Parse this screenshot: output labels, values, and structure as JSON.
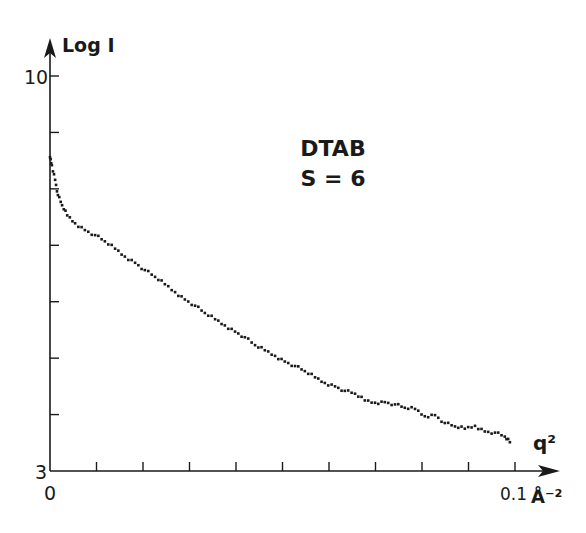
{
  "chart_data": {
    "type": "scatter",
    "title": "",
    "annotation": [
      "DTAB",
      "S = 6"
    ],
    "xlabel": "q²",
    "xunit": "Å⁻²",
    "ylabel": "Log I",
    "xlim": [
      0,
      0.1
    ],
    "ylim": [
      3,
      10
    ],
    "x_tick_labels": [
      "0",
      "0.1"
    ],
    "x_ticks": [
      0,
      0.01,
      0.02,
      0.03,
      0.04,
      0.05,
      0.06,
      0.07,
      0.08,
      0.09,
      0.1
    ],
    "y_tick_labels": [
      "3",
      "10"
    ],
    "y_ticks": [
      3,
      4,
      5,
      6,
      7,
      8,
      9,
      10
    ],
    "grid": false,
    "legend": null,
    "series": [
      {
        "name": "DTAB S=6",
        "x": [
          0.0,
          0.0004,
          0.0011,
          0.0017,
          0.0026,
          0.0037,
          0.0054,
          0.0075,
          0.0097,
          0.0118,
          0.014,
          0.0161,
          0.0183,
          0.0204,
          0.0226,
          0.0247,
          0.0269,
          0.029,
          0.0312,
          0.0333,
          0.0355,
          0.0376,
          0.0398,
          0.0419,
          0.0441,
          0.0462,
          0.0484,
          0.0505,
          0.0527,
          0.0548,
          0.057,
          0.0591,
          0.0613,
          0.0634,
          0.0656,
          0.0677,
          0.0699,
          0.072,
          0.0742,
          0.0763,
          0.0785,
          0.0806,
          0.0828,
          0.0849,
          0.0871,
          0.0892,
          0.0914,
          0.0935,
          0.0957,
          0.0978,
          0.0989
        ],
        "y": [
          8.56,
          8.42,
          8.16,
          7.89,
          7.71,
          7.53,
          7.39,
          7.27,
          7.18,
          7.07,
          6.94,
          6.8,
          6.69,
          6.56,
          6.44,
          6.31,
          6.17,
          6.04,
          5.93,
          5.8,
          5.69,
          5.58,
          5.47,
          5.37,
          5.23,
          5.14,
          5.04,
          4.94,
          4.86,
          4.77,
          4.66,
          4.56,
          4.5,
          4.42,
          4.37,
          4.25,
          4.21,
          4.22,
          4.18,
          4.12,
          4.1,
          3.97,
          3.99,
          3.85,
          3.79,
          3.75,
          3.8,
          3.7,
          3.68,
          3.61,
          3.51
        ]
      }
    ]
  }
}
